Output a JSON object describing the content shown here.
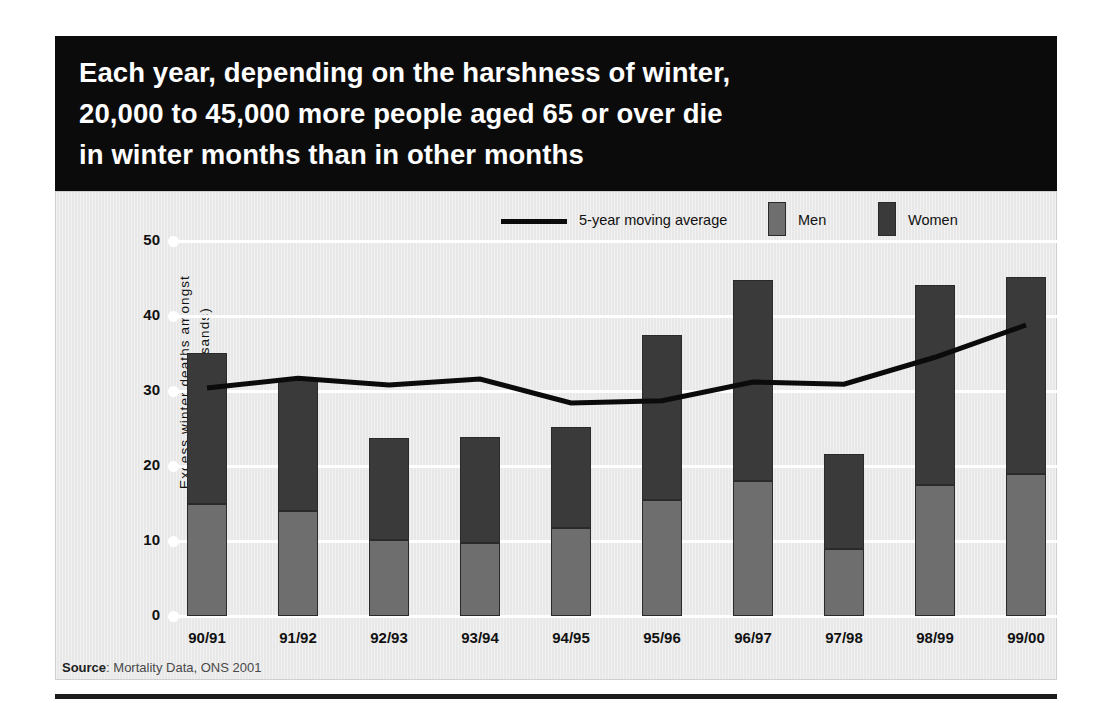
{
  "headline": {
    "line1": "Each year, depending on the harshness of winter,",
    "line2": "20,000 to 45,000 more people aged 65 or over die",
    "line3": "in winter months than in other months"
  },
  "source": {
    "prefix": "Source",
    "text": ": Mortality Data, ONS 2001"
  },
  "legend": {
    "line_label": "5-year moving average",
    "men_label": "Men",
    "women_label": "Women"
  },
  "colors": {
    "banner": "#0b0b0b",
    "panel": "#e8e8e8",
    "men": "#6e6e6e",
    "women": "#3a3a3a",
    "line": "#0b0b0b",
    "gridline": "#ffffff"
  },
  "axis": {
    "y_title_line1": "Excess winter deaths amongst",
    "y_title_line2": "over-65s (thousands)",
    "y_ticks": [
      "50",
      "40",
      "30",
      "20",
      "10",
      "0"
    ]
  },
  "chart_data": {
    "type": "bar",
    "title": "Each year, depending on the harshness of winter, 20,000 to 45,000 more people aged 65 or over die in winter months than in other months",
    "xlabel": "",
    "ylabel": "Excess winter deaths amongst over-65s (thousands)",
    "ylim": [
      0,
      50
    ],
    "yticks": [
      0,
      10,
      20,
      30,
      40,
      50
    ],
    "grid": true,
    "stacked": true,
    "legend_position": "top",
    "categories": [
      "90/91",
      "91/92",
      "92/93",
      "93/94",
      "94/95",
      "95/96",
      "96/97",
      "97/98",
      "98/99",
      "99/00"
    ],
    "series": [
      {
        "name": "Men",
        "values": [
          15.0,
          14.0,
          10.2,
          9.8,
          11.7,
          15.5,
          18.0,
          9.0,
          17.5,
          19.0
        ]
      },
      {
        "name": "Women",
        "values": [
          20.1,
          17.7,
          13.5,
          14.1,
          13.5,
          22.0,
          26.8,
          12.6,
          26.7,
          26.2
        ]
      }
    ],
    "totals": [
      35.1,
      31.7,
      23.7,
      23.9,
      25.2,
      37.5,
      44.8,
      21.6,
      44.2,
      45.2
    ],
    "overlay_line": {
      "name": "5-year moving average",
      "values": [
        30.4,
        31.7,
        30.8,
        31.6,
        28.4,
        28.7,
        31.2,
        30.9,
        34.5,
        38.8
      ]
    },
    "annotations": [
      "Source: Mortality Data, ONS 2001"
    ]
  }
}
